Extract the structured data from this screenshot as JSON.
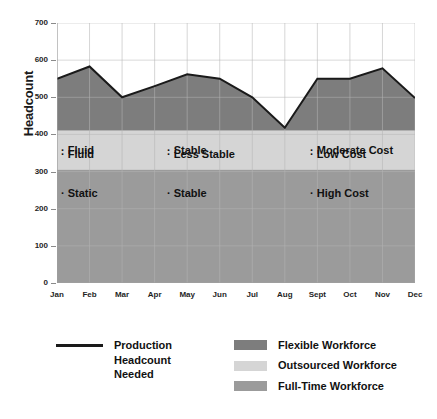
{
  "chart_data": {
    "type": "area",
    "title": "",
    "xlabel": "",
    "ylabel": "Headcount",
    "categories": [
      "Jan",
      "Feb",
      "Mar",
      "Apr",
      "May",
      "Jun",
      "Jul",
      "Aug",
      "Sept",
      "Oct",
      "Nov",
      "Dec"
    ],
    "ylim": [
      0,
      700
    ],
    "yticks": [
      0,
      100,
      200,
      300,
      400,
      500,
      600,
      700
    ],
    "grid": true,
    "legend_position": "bottom",
    "series": [
      {
        "name": "Production Headcount Needed",
        "type": "line",
        "color": "#1a1a1a",
        "values": [
          550,
          583,
          500,
          530,
          562,
          550,
          500,
          418,
          550,
          550,
          578,
          498
        ]
      }
    ],
    "bands": [
      {
        "name": "Flexible Workforce",
        "from": 410,
        "to": 700,
        "color": "#7d7d7d"
      },
      {
        "name": "Outsourced Workforce",
        "from": 305,
        "to": 410,
        "color": "#d5d5d5"
      },
      {
        "name": "Full-Time Workforce",
        "from": 0,
        "to": 305,
        "color": "#9b9b9b"
      }
    ],
    "annotations": [
      {
        "text": "· Fluid",
        "band": "Flexible Workforce",
        "column": 1
      },
      {
        "text": "· Less Stable",
        "band": "Flexible Workforce",
        "column": 2
      },
      {
        "text": "· Low Cost",
        "band": "Flexible Workforce",
        "column": 3
      },
      {
        "text": "· Fluid",
        "band": "Outsourced Workforce",
        "column": 1
      },
      {
        "text": "· Stable",
        "band": "Outsourced Workforce",
        "column": 2
      },
      {
        "text": "· Moderate Cost",
        "band": "Outsourced Workforce",
        "column": 3
      },
      {
        "text": "· Static",
        "band": "Full-Time Workforce",
        "column": 1
      },
      {
        "text": "· Stable",
        "band": "Full-Time Workforce",
        "column": 2
      },
      {
        "text": "· High Cost",
        "band": "Full-Time Workforce",
        "column": 3
      }
    ]
  },
  "axis": {
    "y_title": "Headcount",
    "y_labels": [
      "700",
      "600",
      "500",
      "400",
      "300",
      "200",
      "100",
      "0"
    ],
    "x_labels": [
      "Jan",
      "Feb",
      "Mar",
      "Apr",
      "May",
      "Jun",
      "Jul",
      "Aug",
      "Sept",
      "Oct",
      "Nov",
      "Dec"
    ]
  },
  "legend": {
    "line_entry": {
      "label": "Production\nHeadcount\nNeeded",
      "color": "#1a1a1a"
    },
    "band_entries": [
      {
        "label": "Flexible Workforce",
        "color": "#7d7d7d"
      },
      {
        "label": "Outsourced Workforce",
        "color": "#d5d5d5"
      },
      {
        "label": "Full-Time Workforce",
        "color": "#9b9b9b"
      }
    ]
  },
  "annotations_grid": {
    "row_flexible": [
      "· Fluid",
      "· Less Stable",
      "· Low Cost"
    ],
    "row_outsourced": [
      "· Fluid",
      "· Stable",
      "· Moderate Cost"
    ],
    "row_fulltime": [
      "· Static",
      "· Stable",
      "· High Cost"
    ]
  },
  "colors": {
    "flexible": "#7d7d7d",
    "outsourced": "#d5d5d5",
    "fulltime": "#9b9b9b",
    "line": "#1a1a1a",
    "grid": "#cfcfcf",
    "grid_on_band": "#b5b5b5",
    "background": "#ffffff"
  }
}
